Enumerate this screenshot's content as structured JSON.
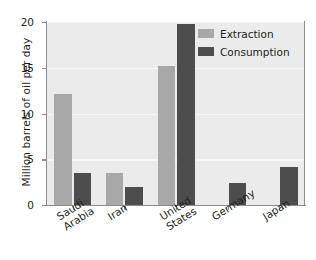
{
  "chart_data": {
    "type": "bar",
    "title": "",
    "xlabel": "",
    "ylabel": "Million barrels of oil per day",
    "ylim": [
      0,
      20
    ],
    "yticks": [
      0,
      5,
      10,
      15,
      20
    ],
    "ytick_labels": [
      "0",
      "5",
      "10",
      "15",
      "20"
    ],
    "grid": true,
    "legend_position": "top-right",
    "categories": [
      "Saudi Arabia",
      "Iran",
      "United States",
      "Germany",
      "Japan"
    ],
    "category_lines": [
      [
        "Saudi",
        "Arabia"
      ],
      [
        "Iran",
        ""
      ],
      [
        "United",
        "States"
      ],
      [
        "Germany",
        ""
      ],
      [
        "Japan",
        ""
      ]
    ],
    "series": [
      {
        "name": "Extraction",
        "color": "#a8a8a8",
        "values": [
          12.1,
          3.5,
          15.2,
          0.0,
          0.0
        ]
      },
      {
        "name": "Consumption",
        "color": "#4d4d4d",
        "values": [
          3.5,
          2.0,
          19.8,
          2.4,
          4.2
        ]
      }
    ]
  },
  "axes": {
    "y_title": "Million barrels of oil per day"
  },
  "legend": {
    "items": [
      {
        "label": "Extraction",
        "swatch": "#a8a8a8"
      },
      {
        "label": "Consumption",
        "swatch": "#4d4d4d"
      }
    ]
  }
}
